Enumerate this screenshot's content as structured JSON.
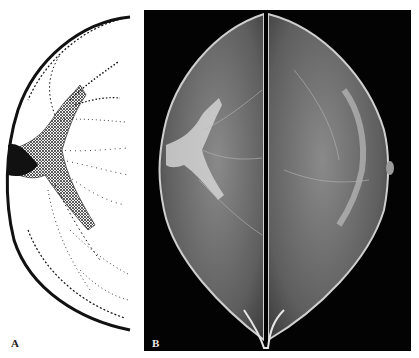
{
  "figure": {
    "panels": [
      {
        "label": "A",
        "content": "stippled anatomical drawing of breast ducts converging toward nipple (left)"
      },
      {
        "label": "B",
        "content": "pair of mammograms (left and right breast) mirrored along a central divider"
      }
    ],
    "colors": {
      "background": "#ffffff",
      "stipple_ink": "#111111",
      "xray_background": "#030303",
      "xray_tissue": "#9a9a9a",
      "xray_highlight": "#e6e6e6"
    }
  }
}
